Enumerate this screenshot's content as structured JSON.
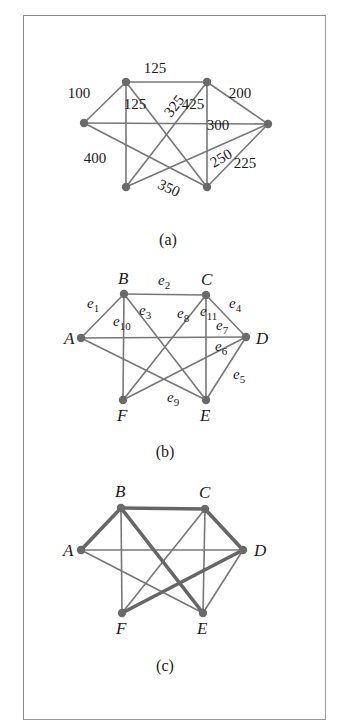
{
  "figures": [
    {
      "id": "a",
      "caption": "(a)",
      "nodes": [
        {
          "id": "A",
          "x": 84,
          "y": 123
        },
        {
          "id": "B",
          "x": 126,
          "y": 82
        },
        {
          "id": "C",
          "x": 207,
          "y": 82
        },
        {
          "id": "D",
          "x": 268,
          "y": 124
        },
        {
          "id": "E",
          "x": 207,
          "y": 187
        },
        {
          "id": "F",
          "x": 126,
          "y": 187
        }
      ],
      "edges": [
        {
          "from": "A",
          "to": "B",
          "weight": "100"
        },
        {
          "from": "B",
          "to": "C",
          "weight": "125"
        },
        {
          "from": "C",
          "to": "D",
          "weight": "200"
        },
        {
          "from": "A",
          "to": "D",
          "weight": "300"
        },
        {
          "from": "B",
          "to": "F",
          "weight": "400"
        },
        {
          "from": "B",
          "to": "E",
          "weight": "125"
        },
        {
          "from": "C",
          "to": "F",
          "weight": "325"
        },
        {
          "from": "C",
          "to": "E",
          "weight": "425"
        },
        {
          "from": "D",
          "to": "F",
          "weight": "250"
        },
        {
          "from": "D",
          "to": "E",
          "weight": "225"
        },
        {
          "from": "A",
          "to": "E",
          "weight": "350"
        }
      ],
      "weight_labels": [
        {
          "text": "100",
          "x": 79,
          "y": 98,
          "rot": 0
        },
        {
          "text": "125",
          "x": 155,
          "y": 73,
          "rot": 0
        },
        {
          "text": "200",
          "x": 240,
          "y": 98,
          "rot": 0
        },
        {
          "text": "300",
          "x": 218,
          "y": 130,
          "rot": 0
        },
        {
          "text": "400",
          "x": 95,
          "y": 163,
          "rot": 0
        },
        {
          "text": "125",
          "x": 135,
          "y": 109,
          "rot": 0
        },
        {
          "text": "325",
          "x": 174,
          "y": 111,
          "rot": -52
        },
        {
          "text": "425",
          "x": 193,
          "y": 109,
          "rot": 0
        },
        {
          "text": "250",
          "x": 221,
          "y": 163,
          "rot": -30
        },
        {
          "text": "225",
          "x": 245,
          "y": 168,
          "rot": 0
        },
        {
          "text": "350",
          "x": 169,
          "y": 193,
          "rot": 25
        }
      ]
    },
    {
      "id": "b",
      "caption": "(b)",
      "nodes": [
        {
          "id": "A",
          "x": 81,
          "y": 338,
          "label": "A",
          "lx": 64,
          "ly": 344
        },
        {
          "id": "B",
          "x": 124,
          "y": 294,
          "label": "B",
          "lx": 118,
          "ly": 284
        },
        {
          "id": "C",
          "x": 206,
          "y": 295,
          "label": "C",
          "lx": 201,
          "ly": 285
        },
        {
          "id": "D",
          "x": 246,
          "y": 337,
          "label": "D",
          "lx": 256,
          "ly": 344
        },
        {
          "id": "E",
          "x": 206,
          "y": 400,
          "label": "E",
          "lx": 200,
          "ly": 421
        },
        {
          "id": "F",
          "x": 123,
          "y": 400,
          "label": "F",
          "lx": 117,
          "ly": 421
        }
      ],
      "edges": [
        {
          "from": "A",
          "to": "B",
          "name": "e",
          "sub": "1"
        },
        {
          "from": "B",
          "to": "C",
          "name": "e",
          "sub": "2"
        },
        {
          "from": "B",
          "to": "E",
          "name": "e",
          "sub": "3"
        },
        {
          "from": "C",
          "to": "D",
          "name": "e",
          "sub": "4"
        },
        {
          "from": "D",
          "to": "E",
          "name": "e",
          "sub": "5"
        },
        {
          "from": "D",
          "to": "F",
          "name": "e",
          "sub": "6"
        },
        {
          "from": "A",
          "to": "D",
          "name": "e",
          "sub": "7"
        },
        {
          "from": "C",
          "to": "F",
          "name": "e",
          "sub": "8"
        },
        {
          "from": "A",
          "to": "E",
          "name": "e",
          "sub": "9"
        },
        {
          "from": "B",
          "to": "F",
          "name": "e",
          "sub": "10"
        },
        {
          "from": "C",
          "to": "E",
          "name": "e",
          "sub": "11"
        }
      ],
      "edge_labels": [
        {
          "name": "e",
          "sub": "1",
          "x": 87,
          "y": 308
        },
        {
          "name": "e",
          "sub": "2",
          "x": 158,
          "y": 285
        },
        {
          "name": "e",
          "sub": "3",
          "x": 139,
          "y": 315
        },
        {
          "name": "e",
          "sub": "4",
          "x": 229,
          "y": 308
        },
        {
          "name": "e",
          "sub": "5",
          "x": 233,
          "y": 379
        },
        {
          "name": "e",
          "sub": "6",
          "x": 215,
          "y": 351
        },
        {
          "name": "e",
          "sub": "7",
          "x": 216,
          "y": 330
        },
        {
          "name": "e",
          "sub": "8",
          "x": 177,
          "y": 318
        },
        {
          "name": "e",
          "sub": "9",
          "x": 167,
          "y": 402
        },
        {
          "name": "e",
          "sub": "10",
          "x": 113,
          "y": 326
        },
        {
          "name": "e",
          "sub": "11",
          "x": 200,
          "y": 316
        }
      ]
    },
    {
      "id": "c",
      "caption": "(c)",
      "nodes": [
        {
          "id": "A",
          "x": 81,
          "y": 550,
          "label": "A",
          "lx": 63,
          "ly": 556
        },
        {
          "id": "B",
          "x": 121,
          "y": 508,
          "label": "B",
          "lx": 115,
          "ly": 497
        },
        {
          "id": "C",
          "x": 205,
          "y": 509,
          "label": "C",
          "lx": 199,
          "ly": 498
        },
        {
          "id": "D",
          "x": 243,
          "y": 550,
          "label": "D",
          "lx": 254,
          "ly": 556
        },
        {
          "id": "E",
          "x": 203,
          "y": 613,
          "label": "E",
          "lx": 197,
          "ly": 634
        },
        {
          "id": "F",
          "x": 122,
          "y": 613,
          "label": "F",
          "lx": 116,
          "ly": 634
        }
      ],
      "edges": [
        {
          "from": "A",
          "to": "B",
          "bold": true
        },
        {
          "from": "B",
          "to": "C",
          "bold": true
        },
        {
          "from": "C",
          "to": "D",
          "bold": true
        },
        {
          "from": "B",
          "to": "E",
          "bold": true
        },
        {
          "from": "D",
          "to": "F",
          "bold": true
        },
        {
          "from": "A",
          "to": "D",
          "bold": false
        },
        {
          "from": "A",
          "to": "E",
          "bold": false
        },
        {
          "from": "B",
          "to": "F",
          "bold": false
        },
        {
          "from": "C",
          "to": "F",
          "bold": false
        },
        {
          "from": "C",
          "to": "E",
          "bold": false
        },
        {
          "from": "D",
          "to": "E",
          "bold": false
        }
      ]
    }
  ],
  "captions": {
    "a": "(a)",
    "b": "(b)",
    "c": "(c)"
  }
}
